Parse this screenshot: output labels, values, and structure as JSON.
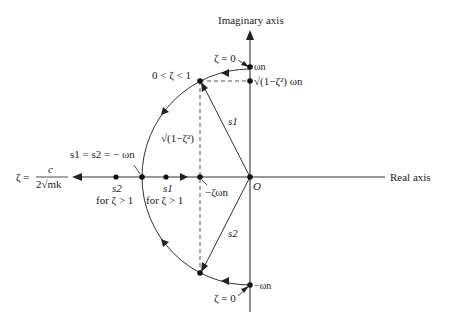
{
  "diagram": {
    "type": "s-plane root locus of damped oscillator",
    "axes": {
      "imaginary_label": "Imaginary axis",
      "real_label": "Real axis",
      "origin_label": "O"
    },
    "labels": {
      "zeta_zero_top": "ζ = 0",
      "zeta_zero_bottom": "ζ = 0",
      "omega_n": "ωn",
      "neg_omega_n": "−ωn",
      "sqrt_omega": "√(1−ζ²) ωn",
      "underdamped": "0 < ζ < 1",
      "sqrt_vertical": "√(1−ζ²)",
      "s1_upper": "s1",
      "s2_lower": "s2",
      "critical": "s1 = s2 = − ωn",
      "neg_zeta_omega": "−ζωn",
      "s2_real": "s2",
      "s1_real": "s1",
      "s2_cond": "for ζ > 1",
      "s1_cond": "for ζ > 1",
      "zeta_def_lhs": "ζ =",
      "zeta_def_num": "c",
      "zeta_def_den": "2√mk"
    },
    "colors": {
      "ink": "#222222",
      "background": "#ffffff"
    }
  }
}
